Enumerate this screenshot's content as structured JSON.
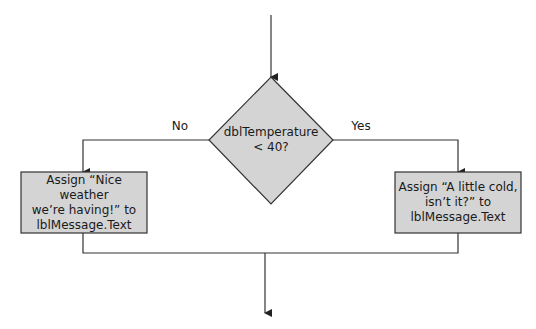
{
  "diagram": {
    "type": "flowchart",
    "decision": {
      "line1": "dblTemperature",
      "line2": "< 40?"
    },
    "branches": {
      "no_label": "No",
      "yes_label": "Yes"
    },
    "left_box": {
      "line1": "Assign “Nice weather",
      "line2": "we’re having!” to",
      "line3": "lblMessage.Text"
    },
    "right_box": {
      "line1": "Assign “A little cold,",
      "line2": "isn’t it?” to",
      "line3": "lblMessage.Text"
    },
    "colors": {
      "shape_fill": "#d4d4d4",
      "line": "#333333",
      "background": "#ffffff"
    }
  }
}
